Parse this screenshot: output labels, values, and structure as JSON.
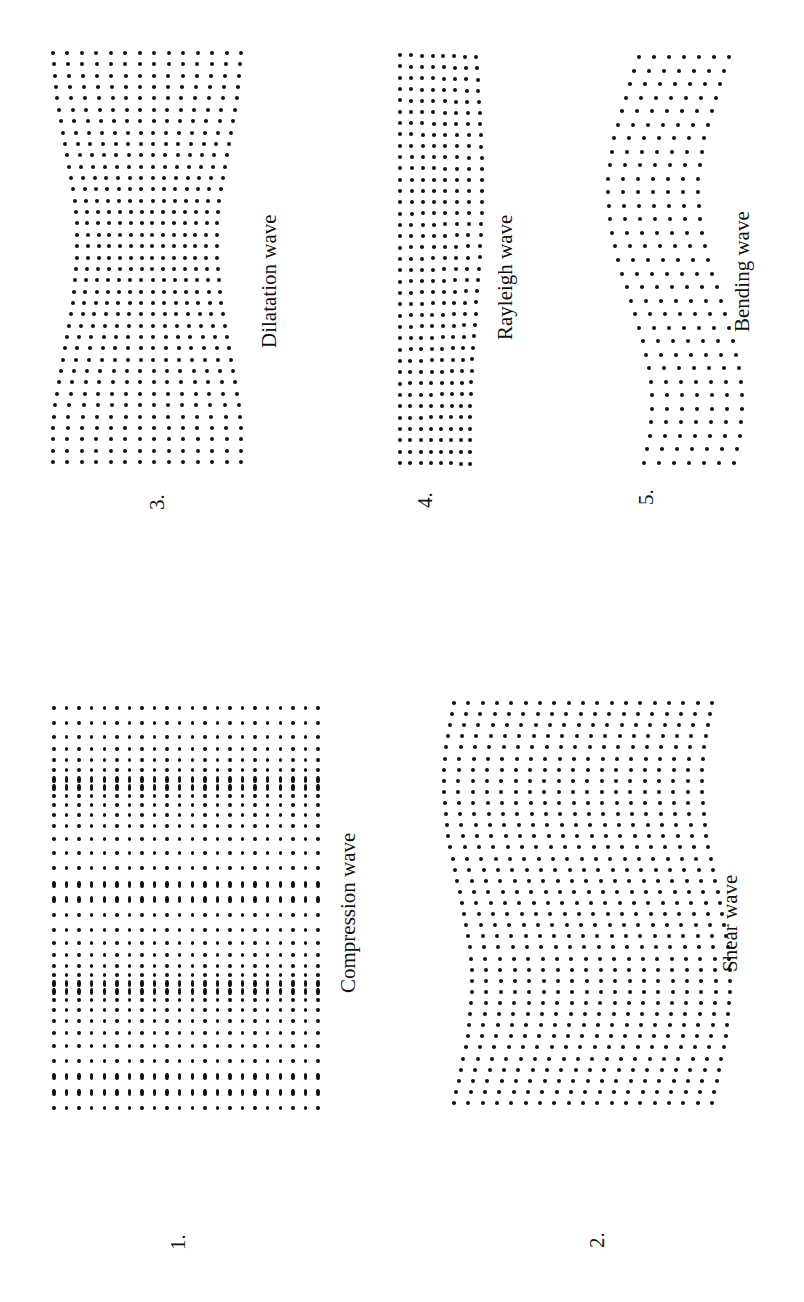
{
  "figure": {
    "panels": [
      {
        "id": "1",
        "number": "1.",
        "label": "Compression wave"
      },
      {
        "id": "2",
        "number": "2.",
        "label": "Shear wave"
      },
      {
        "id": "3",
        "number": "3.",
        "label": "Dilatation wave"
      },
      {
        "id": "4",
        "number": "4.",
        "label": "Rayleigh wave"
      },
      {
        "id": "5",
        "number": "5.",
        "label": "Bending wave"
      }
    ]
  }
}
